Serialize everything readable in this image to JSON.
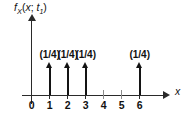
{
  "figure": {
    "y_axis_label": {
      "func": "f",
      "func_sub": "X",
      "open_paren": "(",
      "var": "x",
      "semicolon": ";",
      "time": "t",
      "time_sub": "1",
      "close_paren": ")",
      "full_text": "fX(x; t1)"
    },
    "x_axis_label": "x",
    "axis_color": "#2a2a2a",
    "impulse_color": "#141414",
    "minor_tick_color": "#8c8c8c",
    "background": "#ffffff"
  },
  "chart_data": {
    "type": "scatter",
    "title": "",
    "subtitle": "",
    "xlabel": "x",
    "ylabel": "fX(x; t1)",
    "xlim": [
      -0.5,
      7.2
    ],
    "ylim": [
      0,
      1
    ],
    "grid": false,
    "legend": null,
    "x_tick_labels": [
      "0",
      "1",
      "2",
      "3",
      "4",
      "5",
      "6"
    ],
    "x_tick_values": [
      0,
      1,
      2,
      3,
      4,
      5,
      6
    ],
    "impulses": [
      {
        "x": 1,
        "weight_label": "(1/4)",
        "weight": 0.25
      },
      {
        "x": 2,
        "weight_label": "(1/4)",
        "weight": 0.25
      },
      {
        "x": 3,
        "weight_label": "(1/4)",
        "weight": 0.25
      },
      {
        "x": 6,
        "weight_label": "(1/4)",
        "weight": 0.25
      }
    ],
    "empty_positions": [
      0,
      4,
      5
    ]
  }
}
